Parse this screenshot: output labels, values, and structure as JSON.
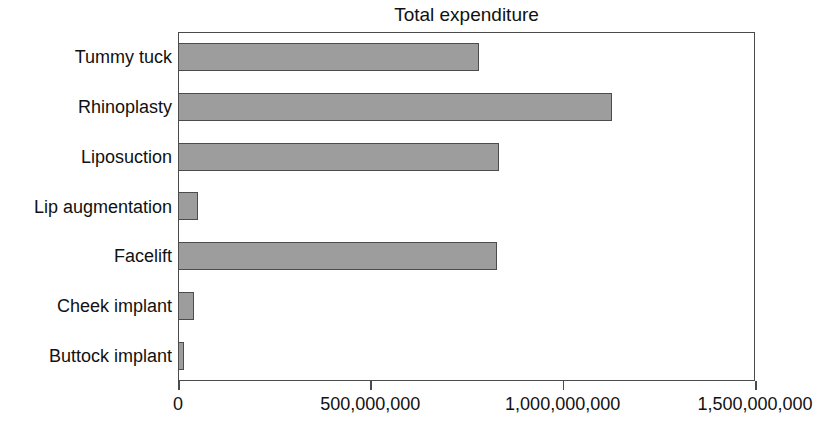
{
  "chart_data": {
    "type": "bar",
    "orientation": "horizontal",
    "title": "Total expenditure",
    "xlabel": "",
    "ylabel": "",
    "categories": [
      "Tummy tuck",
      "Rhinoplasty",
      "Liposuction",
      "Lip augmentation",
      "Facelift",
      "Cheek implant",
      "Buttock implant"
    ],
    "values": [
      783000000,
      1128000000,
      835000000,
      52000000,
      830000000,
      42000000,
      16000000
    ],
    "xlim": [
      0,
      1500000000
    ],
    "xticks": [
      0,
      500000000,
      1000000000,
      1500000000
    ],
    "xtick_labels": [
      "0",
      "500,000,000",
      "1,000,000,000",
      "1,500,000,000"
    ],
    "grid": false,
    "legend": false,
    "bar_fill_color": "#9d9d9d",
    "bar_border_color": "#4c4c4c",
    "axis_color": "#4a4a4a",
    "background_color": "#ffffff"
  }
}
